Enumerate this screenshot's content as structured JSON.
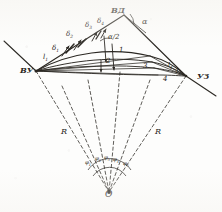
{
  "figure": {
    "kind": "geometric-survey-diagram",
    "ink_color": "#2a2722",
    "paper_color": "#fdfdfc"
  },
  "vertices": {
    "left_label": "ВУ",
    "right_label": "УЗ",
    "apex_label": "ВД",
    "centre_label": "О"
  },
  "angles": {
    "alpha": "α",
    "alpha_half": "α/2",
    "deltas": [
      "δ",
      "δ",
      "δ",
      "δ"
    ],
    "delta_subs": [
      "1",
      "2",
      "3",
      "4"
    ],
    "phis": [
      "φ",
      "φ",
      "φ",
      "φ",
      "φ"
    ],
    "phi_subs": [
      "1",
      "2",
      "3",
      "4",
      "5"
    ]
  },
  "curves": {
    "numbers": [
      "1",
      "2",
      "3",
      "4"
    ],
    "tangent_label": "l",
    "tangent_sub": "1",
    "chord_labels": [
      "l",
      "l"
    ],
    "chord_subs": [
      "2",
      "3"
    ]
  },
  "radii": {
    "left_label": "R",
    "right_label": "R"
  }
}
